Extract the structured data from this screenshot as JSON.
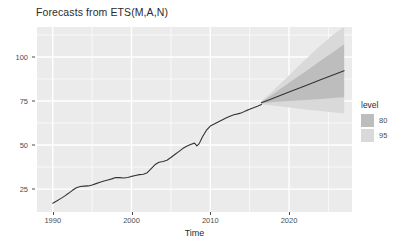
{
  "chart_data": {
    "type": "line",
    "title": "Forecasts from ETS(M,A,N)",
    "xlabel": "Time",
    "ylabel": "",
    "xlim": [
      1988.0,
      2028.0
    ],
    "ylim": [
      12.0,
      117.0
    ],
    "grid": true,
    "legend_position": "right",
    "legend_title": "level",
    "x_ticks": [
      1990,
      2000,
      2010,
      2020
    ],
    "x_tick_labels": [
      "1990",
      "2000",
      "2010",
      "2020"
    ],
    "y_ticks": [
      25,
      50,
      75,
      100
    ],
    "y_tick_labels": [
      "25",
      "50",
      "75",
      "100"
    ],
    "x_minor_ticks": [
      1995,
      2005,
      2015,
      2025
    ],
    "y_minor_ticks": [
      37.5,
      62.5,
      87.5,
      112.5
    ],
    "panel_background": "#ebebeb",
    "gridline_color": "#ffffff",
    "series": [
      {
        "name": "observed",
        "type": "line",
        "color": "#333333",
        "x": [
          1990.0,
          1990.5,
          1991.0,
          1991.5,
          1992.0,
          1992.5,
          1993.0,
          1993.5,
          1994.0,
          1994.5,
          1995.0,
          1995.5,
          1996.0,
          1996.5,
          1997.0,
          1997.5,
          1998.0,
          1998.5,
          1999.0,
          1999.5,
          2000.0,
          2000.5,
          2001.0,
          2001.5,
          2002.0,
          2002.5,
          2003.0,
          2003.5,
          2004.0,
          2004.5,
          2005.0,
          2005.5,
          2006.0,
          2006.5,
          2007.0,
          2007.5,
          2008.0,
          2008.3,
          2008.6,
          2009.0,
          2009.5,
          2010.0,
          2010.5,
          2011.0,
          2011.5,
          2012.0,
          2012.5,
          2013.0,
          2013.5,
          2014.0,
          2014.5,
          2015.0,
          2015.5,
          2016.0,
          2016.5
        ],
        "y": [
          17.0,
          18.2,
          19.6,
          21.0,
          22.6,
          24.3,
          25.8,
          26.5,
          26.7,
          26.8,
          27.3,
          28.1,
          28.9,
          29.6,
          30.2,
          30.8,
          31.6,
          31.5,
          31.3,
          31.6,
          32.2,
          32.7,
          33.2,
          33.4,
          34.3,
          36.6,
          38.9,
          40.2,
          40.7,
          41.4,
          42.9,
          44.6,
          46.3,
          48.0,
          49.3,
          50.3,
          51.1,
          49.5,
          50.8,
          54.6,
          58.3,
          60.8,
          61.9,
          63.1,
          64.2,
          65.3,
          66.4,
          67.2,
          67.7,
          68.3,
          69.4,
          70.3,
          71.2,
          72.0,
          73.0
        ]
      },
      {
        "name": "forecast-mean",
        "type": "line",
        "color": "#333333",
        "x": [
          2016.5,
          2018.0,
          2020.0,
          2022.0,
          2024.0,
          2026.0,
          2027.0
        ],
        "y": [
          74.0,
          76.6,
          80.1,
          83.5,
          87.0,
          90.5,
          92.2
        ]
      }
    ],
    "intervals": [
      {
        "name": "95",
        "level": 95,
        "color": "#d9d9d9",
        "x": [
          2016.5,
          2018.0,
          2020.0,
          2022.0,
          2024.0,
          2026.0,
          2027.0
        ],
        "lower": [
          73.2,
          72.5,
          71.3,
          70.2,
          69.3,
          68.4,
          68.0
        ],
        "upper": [
          74.8,
          81.0,
          89.5,
          98.3,
          106.5,
          114.0,
          117.0
        ]
      },
      {
        "name": "80",
        "level": 80,
        "color": "#bdbdbd",
        "x": [
          2016.5,
          2018.0,
          2020.0,
          2022.0,
          2024.0,
          2026.0,
          2027.0
        ],
        "lower": [
          73.6,
          74.4,
          75.0,
          75.6,
          76.2,
          76.8,
          77.1
        ],
        "upper": [
          74.4,
          79.0,
          85.3,
          91.5,
          97.8,
          104.0,
          107.2
        ]
      }
    ],
    "legend_entries": [
      {
        "label": "80",
        "color": "#bdbdbd"
      },
      {
        "label": "95",
        "color": "#d9d9d9"
      }
    ]
  }
}
